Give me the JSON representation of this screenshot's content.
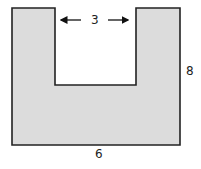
{
  "figure": {
    "fill_color": "#dcdcdc",
    "stroke_color": "#222222",
    "labels": {
      "notch_width": "3",
      "height": "8",
      "base_width": "6"
    }
  }
}
